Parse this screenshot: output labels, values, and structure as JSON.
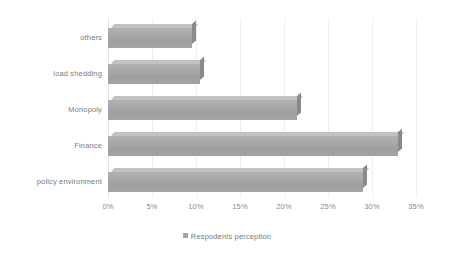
{
  "chart_data": {
    "type": "bar",
    "orientation": "horizontal",
    "title": "",
    "xlabel": "",
    "ylabel": "",
    "categories": [
      "policy environment",
      "Finance",
      "Monopoly",
      "load shedding",
      "others"
    ],
    "values": [
      29,
      33,
      21.5,
      10.5,
      9.5
    ],
    "series": [
      {
        "name": "Respodents perception",
        "values": [
          29,
          33,
          21.5,
          10.5,
          9.5
        ]
      }
    ],
    "xlim": [
      0,
      35
    ],
    "xtick_values": [
      0,
      5,
      10,
      15,
      20,
      25,
      30,
      35
    ],
    "xtick_labels": [
      "0%",
      "5%",
      "10%",
      "15%",
      "20%",
      "25%",
      "30%",
      "35%"
    ],
    "grid": true,
    "grid_axis": "x",
    "legend": [
      "Respodents perception"
    ],
    "legend_position": "bottom",
    "bar_color": "#a6a6a6",
    "bar_top_color": "#c2c2c2",
    "bar_cap_color": "#8a8a8a",
    "gridline_color": "#ededed",
    "text_color": "#7b7b7b",
    "background_color": "#ffffff",
    "style": "3d"
  },
  "legend": {
    "swatch_name": "legend-swatch",
    "label": "Respodents perception"
  }
}
